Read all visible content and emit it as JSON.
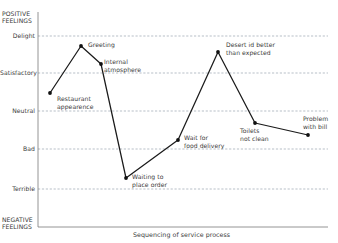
{
  "chart_data": {
    "type": "line",
    "title": "",
    "xlabel": "Sequencing of service process",
    "ylabel": "",
    "grid": true,
    "legend": "none",
    "y_top_label": "POSITIVE FEELINGS",
    "y_bottom_label": "NEGATIVE FEELINGS",
    "y_categories": [
      "Delight",
      "Satisfactory",
      "Neutral",
      "Bad",
      "Terrible"
    ],
    "y_tick_labels": [
      "Delight",
      "Satisfactory",
      "Neutral",
      "Bad",
      "Terrible"
    ],
    "ylim": [
      "NEGATIVE FEELINGS",
      "POSITIVE FEELINGS"
    ],
    "x": [
      1,
      2,
      3,
      4,
      5,
      6,
      7,
      8
    ],
    "categories": [
      "Restaurant appearance",
      "Greeting",
      "Internal atmosphere",
      "Waiting to place order",
      "Wait for food delivery",
      "Desert id better than expected",
      "Toilets not clean",
      "Problem with bill"
    ],
    "values": [
      3.5,
      4.8,
      4.25,
      0.7,
      1.85,
      4.6,
      2.6,
      2.25
    ],
    "points": [
      {
        "label": "Restaurant\nappearence",
        "x": 50,
        "y": 93,
        "label_x": 57,
        "label_y": 95
      },
      {
        "label": "Greeting",
        "x": 81,
        "y": 46,
        "label_x": 88,
        "label_y": 41
      },
      {
        "label": "Internal\natmosphere",
        "x": 101,
        "y": 64,
        "label_x": 104,
        "label_y": 58
      },
      {
        "label": "Waiting to\nplace order",
        "x": 126,
        "y": 178,
        "label_x": 132,
        "label_y": 173
      },
      {
        "label": "Wait for\nfood delivery",
        "x": 178,
        "y": 140,
        "label_x": 184,
        "label_y": 134
      },
      {
        "label": "Desert id better\nthan expected",
        "x": 218,
        "y": 52,
        "label_x": 226,
        "label_y": 41
      },
      {
        "label": "Toilets\nnot clean",
        "x": 255,
        "y": 123,
        "label_x": 240,
        "label_y": 127
      },
      {
        "label": "Problem\nwith bill",
        "x": 308,
        "y": 135,
        "label_x": 303,
        "label_y": 115
      }
    ],
    "gridlines": [
      {
        "label": "Delight",
        "y": 36
      },
      {
        "label": "Satisfactory",
        "y": 73
      },
      {
        "label": "Neutral",
        "y": 111
      },
      {
        "label": "Bad",
        "y": 149
      },
      {
        "label": "Terrible",
        "y": 189
      }
    ],
    "axis": {
      "left_x": 38,
      "baseline_y": 227,
      "right_x": 328,
      "top_y": 12
    },
    "colors": {
      "line": "#1a1a1a",
      "marker": "#111111",
      "grid": "#9aa3b0",
      "axis": "#7a7a7a",
      "text": "#3a3a3a",
      "background": "#ffffff"
    }
  }
}
